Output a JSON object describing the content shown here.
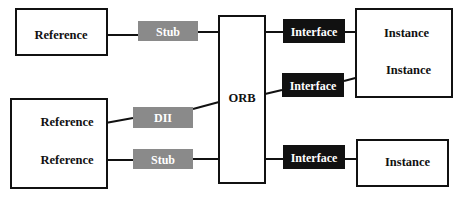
{
  "diagram": {
    "type": "architecture-diagram",
    "colors": {
      "line": "#111111",
      "box_fill": "#ffffff",
      "stub_fill": "#8a8a8a",
      "interface_fill": "#111111",
      "stub_text": "#ffffff",
      "interface_text": "#ffffff",
      "label_text": "#111111"
    },
    "client_top": {
      "reference_label": "Reference"
    },
    "client_bottom": {
      "reference_dii_label": "Reference",
      "reference_stub_label": "Reference"
    },
    "stub_top_label": "Stub",
    "dii_label": "DII",
    "stub_bottom_label": "Stub",
    "orb_label": "ORB",
    "interface_1_label": "Interface",
    "interface_2_label": "Interface",
    "interface_3_label": "Interface",
    "server_top": {
      "instance_1_label": "Instance",
      "instance_2_label": "Instance"
    },
    "server_bottom": {
      "instance_label": "Instance"
    }
  }
}
